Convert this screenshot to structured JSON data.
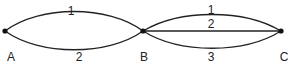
{
  "diagram": {
    "nodes": [
      {
        "id": "A",
        "label": "A",
        "x": 5,
        "y": 31
      },
      {
        "id": "B",
        "label": "B",
        "x": 143,
        "y": 31
      },
      {
        "id": "C",
        "label": "C",
        "x": 281,
        "y": 31
      }
    ],
    "edges": [
      {
        "from": "A",
        "to": "B",
        "label": "1",
        "position": "upper"
      },
      {
        "from": "A",
        "to": "B",
        "label": "2",
        "position": "lower"
      },
      {
        "from": "B",
        "to": "C",
        "label": "1",
        "position": "upper"
      },
      {
        "from": "B",
        "to": "C",
        "label": "2",
        "position": "straight"
      },
      {
        "from": "B",
        "to": "C",
        "label": "3",
        "position": "lower"
      }
    ]
  }
}
